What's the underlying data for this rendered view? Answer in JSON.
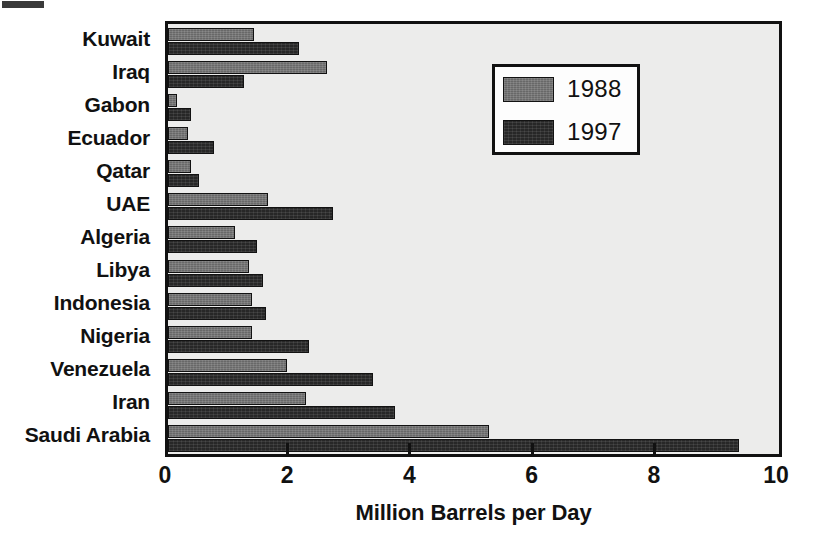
{
  "chart_data": {
    "type": "bar",
    "orientation": "horizontal",
    "title": "",
    "xlabel": "Million Barrels per Day",
    "ylabel": "",
    "xlim": [
      0,
      10
    ],
    "xticks": [
      0,
      2,
      4,
      6,
      8,
      10
    ],
    "xtick_labels": [
      "0",
      "2",
      "4",
      "6",
      "8",
      "10"
    ],
    "grid": false,
    "legend_position": "upper right",
    "categories": [
      "Kuwait",
      "Iraq",
      "Gabon",
      "Ecuador",
      "Qatar",
      "UAE",
      "Algeria",
      "Libya",
      "Indonesia",
      "Nigeria",
      "Venezuela",
      "Iran",
      "Saudi Arabia"
    ],
    "series": [
      {
        "name": "1988",
        "color": "#686868",
        "values": [
          1.4,
          2.6,
          0.15,
          0.33,
          0.37,
          1.63,
          1.1,
          1.32,
          1.37,
          1.37,
          1.94,
          2.26,
          5.25
        ]
      },
      {
        "name": "1997",
        "color": "#272727",
        "values": [
          2.15,
          1.25,
          0.37,
          0.75,
          0.51,
          2.7,
          1.45,
          1.56,
          1.61,
          2.3,
          3.35,
          3.71,
          9.35
        ]
      }
    ]
  },
  "legend": {
    "entries": [
      {
        "label": "1988"
      },
      {
        "label": "1997"
      }
    ]
  },
  "axis": {
    "x_title": "Million Barrels per Day"
  }
}
